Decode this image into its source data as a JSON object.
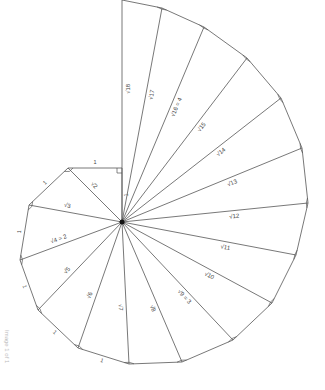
{
  "caption": "Image 1 of 1",
  "diagram": {
    "center": [
      122,
      222
    ],
    "vertices": [
      [
        122,
        168
      ],
      [
        68,
        168
      ],
      [
        29,
        205
      ],
      [
        20,
        260
      ],
      [
        38,
        310
      ],
      [
        78,
        348
      ],
      [
        129,
        364
      ],
      [
        182,
        362
      ],
      [
        233,
        340
      ],
      [
        272,
        303
      ],
      [
        296,
        255
      ],
      [
        308,
        203
      ],
      [
        302,
        148
      ],
      [
        281,
        98
      ],
      [
        247,
        58
      ],
      [
        204,
        27
      ],
      [
        162,
        8
      ],
      [
        122,
        0
      ]
    ],
    "hypotenuse_labels": [
      {
        "text": "√2",
        "index": 2
      },
      {
        "text": "√3",
        "index": 3
      },
      {
        "text": "√4 = 2",
        "index": 4
      },
      {
        "text": "√5",
        "index": 5
      },
      {
        "text": "√6",
        "index": 6
      },
      {
        "text": "√7",
        "index": 7
      },
      {
        "text": "√8",
        "index": 8
      },
      {
        "text": "√9 = 3",
        "index": 9
      },
      {
        "text": "√10",
        "index": 10
      },
      {
        "text": "√11",
        "index": 11
      },
      {
        "text": "√12",
        "index": 12
      },
      {
        "text": "√13",
        "index": 13
      },
      {
        "text": "√14",
        "index": 14
      },
      {
        "text": "√15",
        "index": 15
      },
      {
        "text": "√16 = 4",
        "index": 16
      },
      {
        "text": "√17",
        "index": 17
      },
      {
        "text": "√18",
        "index": 18
      }
    ],
    "unit_leg_label": "1",
    "unit_legs_labeled": [
      0,
      1,
      2,
      3,
      4,
      5,
      6
    ],
    "colors": {
      "line": "#555555",
      "text": "#444444",
      "center": "#111111"
    }
  }
}
